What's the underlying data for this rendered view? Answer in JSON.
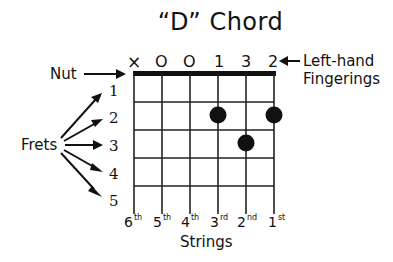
{
  "title": "“D” Chord",
  "open_muted_markers": [
    "×",
    "O",
    "O",
    "1",
    "3",
    "2"
  ],
  "nut_label": "Nut",
  "frets_label": "Frets",
  "fret_numbers": [
    "1",
    "2",
    "3",
    "4",
    "5"
  ],
  "fingerings_label_line1": "Left-hand",
  "fingerings_label_line2": "Fingerings",
  "strings_label": "Strings",
  "string_labels": [
    {
      "num": "6",
      "suffix": "th"
    },
    {
      "num": "5",
      "suffix": "th"
    },
    {
      "num": "4",
      "suffix": "th"
    },
    {
      "num": "3",
      "suffix": "rd"
    },
    {
      "num": "2",
      "suffix": "nd"
    },
    {
      "num": "1",
      "suffix": "st"
    }
  ],
  "finger_positions": [
    {
      "string": "3rd",
      "fret": 2
    },
    {
      "string": "1st",
      "fret": 2
    },
    {
      "string": "2nd",
      "fret": 3
    }
  ]
}
